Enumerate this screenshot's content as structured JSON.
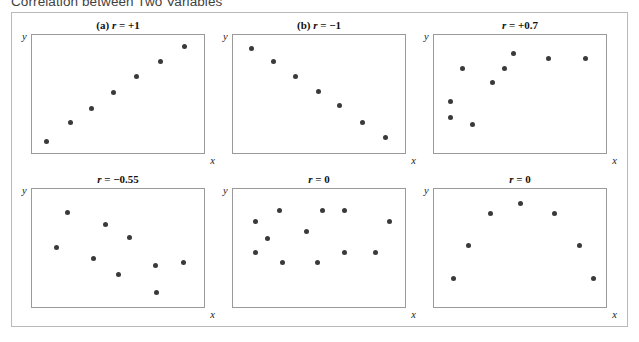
{
  "figure": {
    "caption": "Correlation between Two Variables"
  },
  "axes": {
    "y_label": "y",
    "x_label": "x"
  },
  "chart_data": [
    {
      "type": "scatter",
      "title": "(a) r = +1",
      "label_prefix": "(a)",
      "r": 1,
      "r_text": "r = +1",
      "xlabel": "x",
      "ylabel": "y",
      "xlim": [
        0,
        1
      ],
      "ylim": [
        0,
        1
      ],
      "grid": false,
      "legend": "none",
      "points": [
        {
          "x": 0.085,
          "y": 0.095
        },
        {
          "x": 0.225,
          "y": 0.255
        },
        {
          "x": 0.345,
          "y": 0.375
        },
        {
          "x": 0.475,
          "y": 0.515
        },
        {
          "x": 0.605,
          "y": 0.645
        },
        {
          "x": 0.745,
          "y": 0.775
        },
        {
          "x": 0.885,
          "y": 0.905
        }
      ]
    },
    {
      "type": "scatter",
      "title": "(b) r = -1",
      "label_prefix": "(b)",
      "r": -1,
      "r_text": "r = −1",
      "xlabel": "x",
      "ylabel": "y",
      "xlim": [
        0,
        1
      ],
      "ylim": [
        0,
        1
      ],
      "grid": false,
      "legend": "none",
      "points": [
        {
          "x": 0.105,
          "y": 0.885
        },
        {
          "x": 0.235,
          "y": 0.775
        },
        {
          "x": 0.365,
          "y": 0.65
        },
        {
          "x": 0.495,
          "y": 0.525
        },
        {
          "x": 0.62,
          "y": 0.4
        },
        {
          "x": 0.75,
          "y": 0.26
        },
        {
          "x": 0.885,
          "y": 0.135
        }
      ]
    },
    {
      "type": "scatter",
      "title": "r = +0.7",
      "label_prefix": "",
      "r": 0.7,
      "r_text": "r = +0.7",
      "xlabel": "x",
      "ylabel": "y",
      "xlim": [
        0,
        1
      ],
      "ylim": [
        0,
        1
      ],
      "grid": false,
      "legend": "none",
      "points": [
        {
          "x": 0.095,
          "y": 0.435
        },
        {
          "x": 0.095,
          "y": 0.305
        },
        {
          "x": 0.225,
          "y": 0.245
        },
        {
          "x": 0.165,
          "y": 0.715
        },
        {
          "x": 0.34,
          "y": 0.6
        },
        {
          "x": 0.41,
          "y": 0.715
        },
        {
          "x": 0.46,
          "y": 0.845
        },
        {
          "x": 0.665,
          "y": 0.805
        },
        {
          "x": 0.88,
          "y": 0.805
        }
      ]
    },
    {
      "type": "scatter",
      "title": "r = -0.55",
      "label_prefix": "",
      "r": -0.55,
      "r_text": "r = −0.55",
      "xlabel": "x",
      "ylabel": "y",
      "xlim": [
        0,
        1
      ],
      "ylim": [
        0,
        1
      ],
      "grid": false,
      "legend": "none",
      "points": [
        {
          "x": 0.205,
          "y": 0.805
        },
        {
          "x": 0.425,
          "y": 0.695
        },
        {
          "x": 0.565,
          "y": 0.585
        },
        {
          "x": 0.145,
          "y": 0.505
        },
        {
          "x": 0.355,
          "y": 0.415
        },
        {
          "x": 0.505,
          "y": 0.275
        },
        {
          "x": 0.72,
          "y": 0.355
        },
        {
          "x": 0.88,
          "y": 0.38
        },
        {
          "x": 0.725,
          "y": 0.12
        }
      ]
    },
    {
      "type": "scatter",
      "title": "r = 0",
      "label_prefix": "",
      "r": 0,
      "r_text": "r = 0",
      "xlabel": "x",
      "ylabel": "y",
      "xlim": [
        0,
        1
      ],
      "ylim": [
        0,
        1
      ],
      "grid": false,
      "legend": "none",
      "points": [
        {
          "x": 0.13,
          "y": 0.725
        },
        {
          "x": 0.27,
          "y": 0.82
        },
        {
          "x": 0.52,
          "y": 0.82
        },
        {
          "x": 0.65,
          "y": 0.82
        },
        {
          "x": 0.91,
          "y": 0.725
        },
        {
          "x": 0.425,
          "y": 0.64
        },
        {
          "x": 0.2,
          "y": 0.58
        },
        {
          "x": 0.13,
          "y": 0.465
        },
        {
          "x": 0.65,
          "y": 0.465
        },
        {
          "x": 0.83,
          "y": 0.465
        },
        {
          "x": 0.29,
          "y": 0.375
        },
        {
          "x": 0.49,
          "y": 0.375
        }
      ]
    },
    {
      "type": "scatter",
      "title": "r = 0",
      "label_prefix": "",
      "r": 0,
      "r_text": "r = 0",
      "xlabel": "x",
      "ylabel": "y",
      "xlim": [
        0,
        1
      ],
      "ylim": [
        0,
        1
      ],
      "grid": false,
      "legend": "none",
      "points": [
        {
          "x": 0.5,
          "y": 0.88
        },
        {
          "x": 0.33,
          "y": 0.79
        },
        {
          "x": 0.7,
          "y": 0.79
        },
        {
          "x": 0.2,
          "y": 0.525
        },
        {
          "x": 0.845,
          "y": 0.525
        },
        {
          "x": 0.115,
          "y": 0.24
        },
        {
          "x": 0.925,
          "y": 0.24
        }
      ]
    }
  ]
}
